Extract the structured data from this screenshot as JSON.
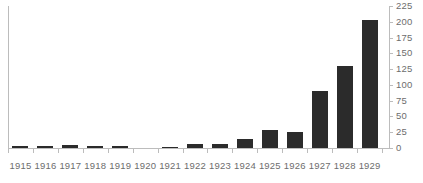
{
  "chart_data": {
    "type": "bar",
    "title": "",
    "subtitle": "",
    "xlabel": "",
    "ylabel": "",
    "categories": [
      "1915",
      "1916",
      "1917",
      "1918",
      "1919",
      "1920",
      "1921",
      "1922",
      "1923",
      "1924",
      "1925",
      "1926",
      "1927",
      "1928",
      "1929"
    ],
    "values": [
      3,
      3,
      4,
      3,
      3,
      0,
      2,
      6,
      6,
      15,
      28,
      26,
      90,
      130,
      203
    ],
    "ylim": [
      0,
      225
    ],
    "ytick_labels": [
      "225",
      "200",
      "175",
      "150",
      "125",
      "100",
      "75",
      "50",
      "25",
      "0"
    ],
    "ytick_values": [
      225,
      200,
      175,
      150,
      125,
      100,
      75,
      50,
      25,
      0
    ],
    "ytick_step": 25,
    "grid": false,
    "legend": false,
    "legend_position": "none",
    "y_axis_position": "right",
    "series": [
      {
        "name": "",
        "values": [
          3,
          3,
          4,
          3,
          3,
          0,
          2,
          6,
          6,
          15,
          28,
          26,
          90,
          130,
          203
        ]
      }
    ]
  },
  "colors": {
    "bar": "#2b2b2b",
    "axis": "#bcbcbc",
    "tick_label": "#6d6d6d",
    "background": "#ffffff"
  }
}
